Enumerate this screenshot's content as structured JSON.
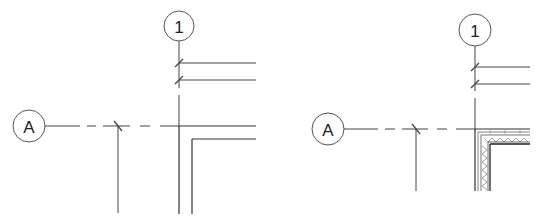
{
  "diagrams": [
    {
      "id": "left",
      "grid_vertical": {
        "label": "1",
        "bubble": {
          "cx": 179,
          "cy": 26,
          "r": 15
        }
      },
      "grid_horizontal": {
        "label": "A",
        "bubble": {
          "cx": 29,
          "cy": 126,
          "r": 16
        }
      },
      "wall_type": "simple"
    },
    {
      "id": "right",
      "grid_vertical": {
        "label": "1",
        "bubble": {
          "cx": 475,
          "cy": 30,
          "r": 16
        }
      },
      "grid_horizontal": {
        "label": "A",
        "bubble": {
          "cx": 328,
          "cy": 129,
          "r": 16
        }
      },
      "wall_type": "layered-with-insulation"
    }
  ],
  "colors": {
    "line": "#444444",
    "wall": "#333333",
    "hatch": "#777777",
    "background": "#ffffff"
  }
}
